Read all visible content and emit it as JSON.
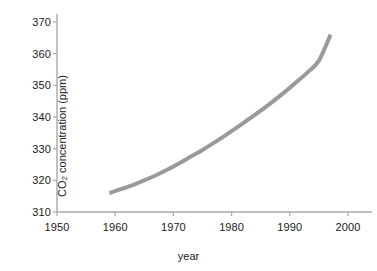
{
  "chart_data": {
    "type": "line",
    "title": "",
    "xlabel": "year",
    "ylabel": "CO2 concentration (ppm)",
    "ylabel_prefix": "CO",
    "ylabel_subscript": "2",
    "ylabel_suffix": " concentration (ppm)",
    "xlim": [
      1950,
      2000
    ],
    "ylim": [
      310,
      370
    ],
    "xticks": [
      1950,
      1960,
      1970,
      1980,
      1990,
      2000
    ],
    "xtick_labels": [
      "1950",
      "1960",
      "1970",
      "1980",
      "1990",
      "2000"
    ],
    "yticks": [
      310,
      320,
      330,
      340,
      350,
      360,
      370
    ],
    "ytick_labels": [
      "310",
      "320",
      "330",
      "340",
      "350",
      "360",
      "370"
    ],
    "grid": false,
    "legend": false,
    "legend_position": "none",
    "series": [
      {
        "name": "CO2 concentration",
        "color": "#9a9a9a",
        "line_width": 4,
        "x": [
          1959,
          1961,
          1963,
          1965,
          1967,
          1969,
          1971,
          1973,
          1975,
          1977,
          1979,
          1981,
          1983,
          1985,
          1987,
          1989,
          1991,
          1993,
          1995,
          1997
        ],
        "values": [
          316.0,
          317.2,
          318.5,
          320.0,
          321.6,
          323.4,
          325.4,
          327.5,
          329.6,
          331.9,
          334.3,
          336.8,
          339.4,
          342.0,
          344.8,
          347.7,
          350.8,
          354.0,
          357.8,
          366.0
        ]
      }
    ],
    "annotations": [],
    "colors": {
      "line": "#9a9a9a",
      "axis": "#a8a8a8",
      "tick": "#a8a8a8",
      "text": "#1a1a1a",
      "background": "#ffffff"
    }
  }
}
